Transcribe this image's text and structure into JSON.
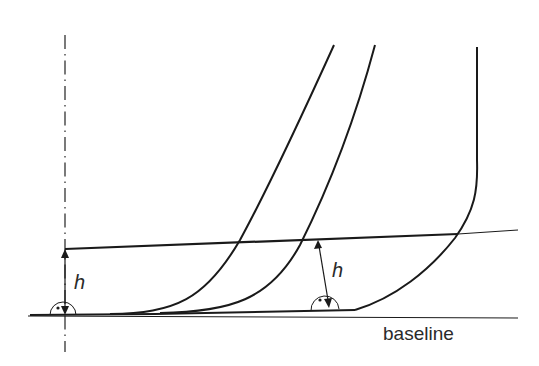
{
  "diagram": {
    "labels": {
      "h_left": "h",
      "h_right": "h",
      "baseline": "baseline"
    },
    "colors": {
      "stroke": "#1a1a1a",
      "text": "#2a2a2a",
      "background": "#ffffff"
    },
    "elements": [
      "dash-dot vertical centerline",
      "baseline (horizontal line)",
      "inclined offset line at height h",
      "three hull section curves",
      "two height-h dimension arrows with right-angle marks"
    ]
  }
}
